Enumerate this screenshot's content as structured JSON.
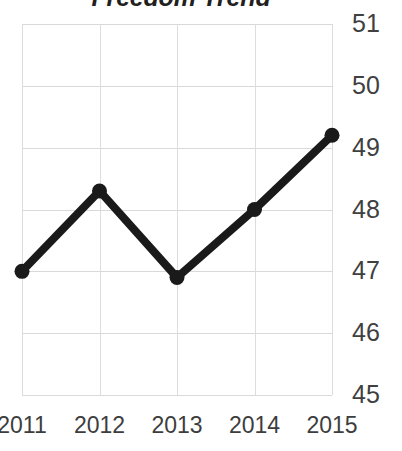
{
  "chart_data": {
    "type": "line",
    "title": "Freedom Trend",
    "xlabel": "",
    "ylabel": "",
    "categories": [
      "2011",
      "2012",
      "2013",
      "2014",
      "2015"
    ],
    "x": [
      2011,
      2012,
      2013,
      2014,
      2015
    ],
    "values": [
      47.0,
      48.3,
      46.9,
      48.0,
      49.2
    ],
    "series": [
      {
        "name": "Freedom Trend",
        "values": [
          47.0,
          48.3,
          46.9,
          48.0,
          49.2
        ]
      }
    ],
    "ylim": [
      45,
      51
    ],
    "yticks": [
      51,
      50,
      49,
      48,
      47,
      46,
      45
    ],
    "ytick_labels": [
      "51",
      "50",
      "49",
      "48",
      "47",
      "46",
      "45"
    ],
    "xtick_labels": [
      "2011",
      "2012",
      "2013",
      "2014",
      "2015"
    ],
    "grid": true,
    "legend": "none",
    "y_axis_position": "right",
    "marker": "circle",
    "line_color": "#1a1a1a",
    "marker_color": "#1a1a1a",
    "grid_color": "#d9d9d9",
    "title_color": "#231f20",
    "tick_label_color": "#404040"
  }
}
